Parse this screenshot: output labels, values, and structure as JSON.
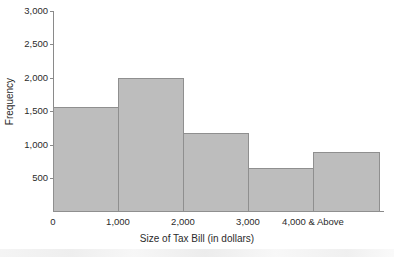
{
  "chart_data": {
    "type": "bar",
    "title": "",
    "xlabel": "Size of Tax Bill (in dollars)",
    "ylabel": "Frequency",
    "categories": [
      "0",
      "1,000",
      "2,000",
      "3,000",
      "4,000 & Above"
    ],
    "bin_edges": [
      "0",
      "1,000",
      "2,000",
      "3,000",
      "4,000",
      "5,000"
    ],
    "values": [
      1570,
      2000,
      1180,
      660,
      890
    ],
    "ylim": [
      0,
      3000
    ],
    "ytick_labels": [
      "500",
      "1,000",
      "1,500",
      "2,000",
      "2,500",
      "3,000"
    ],
    "ytick_values": [
      500,
      1000,
      1500,
      2000,
      2500,
      3000
    ],
    "xtick_labels": [
      "0",
      "1,000",
      "2,000",
      "3,000",
      "4,000 & Above"
    ],
    "grid": false,
    "legend": "none",
    "bar_color": "#bdbdbd",
    "bar_edge_color": "#8f8f8f",
    "axis_color": "#8a8a8a",
    "text_color": "#2b2b2b"
  }
}
